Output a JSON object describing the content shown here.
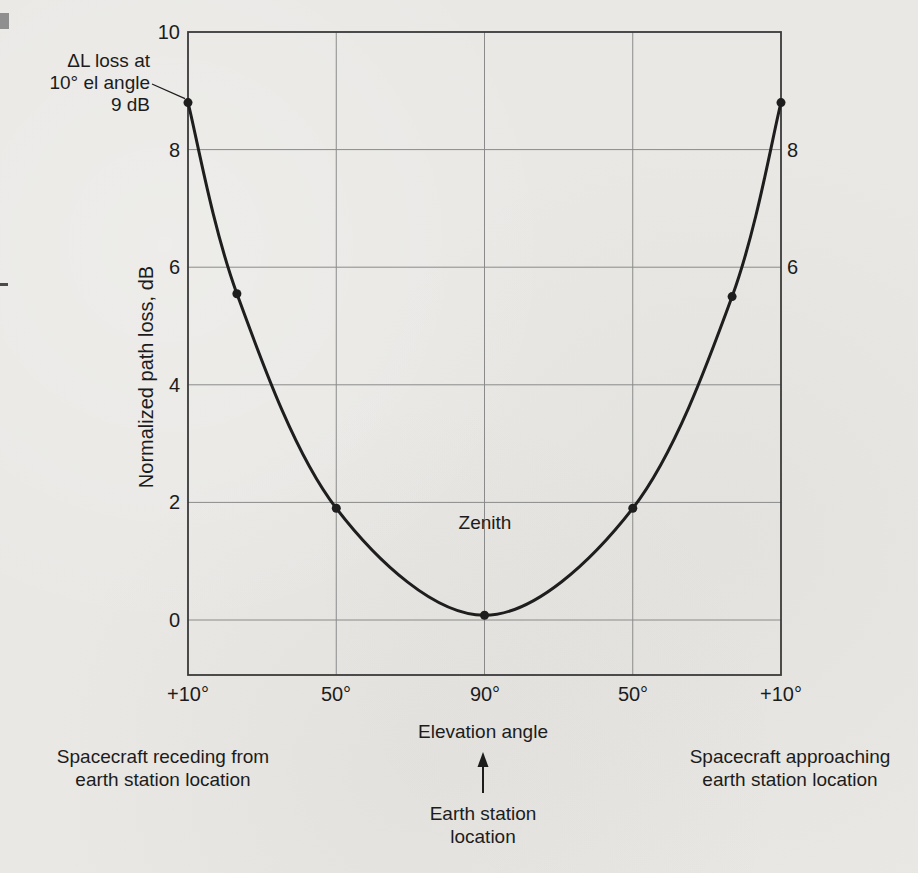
{
  "page": {
    "kind": "scanned textbook figure",
    "background": "#e9e8e5"
  },
  "colors": {
    "paper": "#e9e8e5",
    "ink": "#1c1c1c",
    "curve": "#1e1e1e",
    "grid": "#8a8a8a",
    "frame": "#3a3a3a"
  },
  "chart_data": {
    "type": "line",
    "title": "",
    "ylabel": "Normalized path loss, dB",
    "xlabel": "Elevation angle",
    "grid": true,
    "ylim": [
      -0.95,
      10
    ],
    "y_ticks_left": [
      "10",
      "8",
      "6",
      "4",
      "2",
      "0"
    ],
    "y_tick_values_left": [
      10,
      8,
      6,
      4,
      2,
      0
    ],
    "y_ticks_right": [
      "8",
      "6"
    ],
    "y_tick_values_right": [
      8,
      6
    ],
    "x_tick_labels": [
      "+10°",
      "50°",
      "90°",
      "50°",
      "+10°"
    ],
    "x_tick_positions": [
      0,
      1,
      2,
      3,
      4
    ],
    "series": [
      {
        "name": "Normalized path loss over a spacecraft pass",
        "points": [
          {
            "pos": 0,
            "db": 8.8,
            "elevation": "+10° receding side"
          },
          {
            "pos": 0.33,
            "db": 5.55
          },
          {
            "pos": 1,
            "db": 1.9,
            "elevation": "50°"
          },
          {
            "pos": 2,
            "db": 0.08,
            "elevation": "90° zenith"
          },
          {
            "pos": 3,
            "db": 1.9,
            "elevation": "50°"
          },
          {
            "pos": 3.67,
            "db": 5.5
          },
          {
            "pos": 4,
            "db": 8.8,
            "elevation": "+10° approaching side"
          }
        ]
      }
    ],
    "annotations": {
      "delta_l_lines": [
        "ΔL loss at",
        "10° el angle",
        "9 dB"
      ],
      "zenith": "Zenith"
    },
    "below_axis": {
      "receding_lines": [
        "Spacecraft receding from",
        "earth station location"
      ],
      "approaching_lines": [
        "Spacecraft approaching",
        "earth station location"
      ],
      "earth_station_lines": [
        "Earth station",
        "location"
      ]
    }
  }
}
